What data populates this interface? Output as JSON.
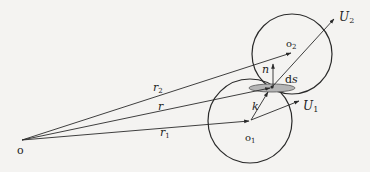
{
  "diagram": {
    "type": "vector-geometry",
    "colors": {
      "stroke": "#2a2a2a",
      "background": "#f4f3f1",
      "ellipse_fill": "#b5b5b5"
    },
    "nodes": [
      {
        "id": "origin",
        "label": "o",
        "x": 22,
        "y": 140
      },
      {
        "id": "center1",
        "label": "o",
        "subscript": "1",
        "x": 250,
        "y": 121
      },
      {
        "id": "center2",
        "label": "o",
        "subscript": "2",
        "x": 292,
        "y": 53
      },
      {
        "id": "contact",
        "label": "",
        "x": 272,
        "y": 87
      }
    ],
    "circles": [
      {
        "id": "particle1",
        "cx": 250,
        "cy": 121,
        "r": 42
      },
      {
        "id": "particle2",
        "cx": 292,
        "cy": 54,
        "r": 40
      }
    ],
    "vectors": [
      {
        "id": "r1",
        "label": "r",
        "subscript": "1",
        "from": "origin",
        "to": "center1"
      },
      {
        "id": "r",
        "label": "r",
        "subscript": "",
        "from": "origin",
        "to": "contact"
      },
      {
        "id": "r2",
        "label": "r",
        "subscript": "2",
        "from": "origin",
        "to": "center2"
      },
      {
        "id": "U1",
        "label": "U",
        "subscript": "1",
        "from": "center1",
        "to": "U1tip"
      },
      {
        "id": "U2",
        "label": "U",
        "subscript": "2",
        "from": "contact",
        "to": "U2tip"
      },
      {
        "id": "n",
        "label": "n",
        "subscript": "",
        "from": "contact",
        "to": "ntip"
      },
      {
        "id": "k",
        "label": "k",
        "subscript": "",
        "from": "center1",
        "to": "contact"
      }
    ],
    "annotations": [
      {
        "id": "ds",
        "label": "ds"
      }
    ]
  },
  "labels": {
    "origin": "o",
    "o1_base": "o",
    "o1_sub": "1",
    "o2_base": "o",
    "o2_sub": "2",
    "r1_base": "r",
    "r1_sub": "1",
    "r_base": "r",
    "r2_base": "r",
    "r2_sub": "2",
    "U1_base": "U",
    "U1_sub": "1",
    "U2_base": "U",
    "U2_sub": "2",
    "n": "n",
    "k": "k",
    "ds_d": "d",
    "ds_s": "s"
  }
}
